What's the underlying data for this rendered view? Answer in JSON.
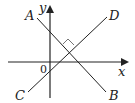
{
  "diagram": {
    "type": "coordinate-geometry",
    "axes": {
      "x_label": "x",
      "y_label": "y",
      "origin_label": "0"
    },
    "lines": [
      {
        "name": "AB",
        "start_label": "A",
        "end_label": "B"
      },
      {
        "name": "CD",
        "start_label": "C",
        "end_label": "D"
      }
    ],
    "annotations": {
      "right_angle": "AB ⊥ CD"
    },
    "colors": {
      "stroke": "#222222",
      "background": "#ffffff"
    }
  }
}
